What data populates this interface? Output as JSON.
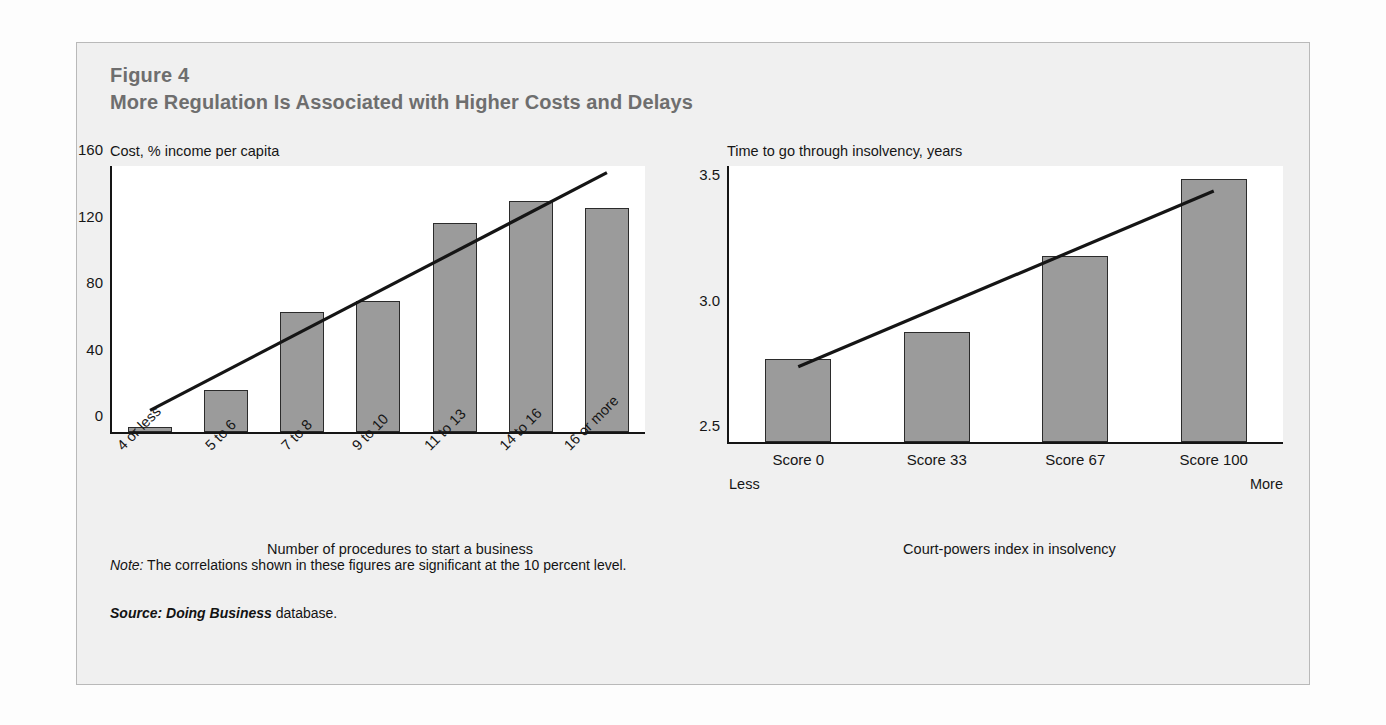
{
  "figure": {
    "number": "Figure 4",
    "title": "More Regulation Is Associated with Higher Costs and Delays",
    "note_label": "Note:",
    "note_text": " The correlations shown in these figures are significant at the 10 percent level.",
    "source_label": "Source:",
    "source_italic": " Doing Business",
    "source_text": " database."
  },
  "colors": {
    "bar_fill": "#9b9b9b",
    "bar_border": "#2b2b2b",
    "panel_bg": "#f0f0f0",
    "plot_bg": "#ffffff",
    "title_gray": "#6e6e6e",
    "axis": "#151515"
  },
  "chart_data": [
    {
      "type": "bar",
      "title": "Cost, % income per capita",
      "xlabel": "Number of procedures to start a business",
      "ylabel": "Cost, % income per capita",
      "categories": [
        "4 or less",
        "5 to 6",
        "7 to 8",
        "9 to 10",
        "11 to 13",
        "14 to 16",
        "16 or more"
      ],
      "values": [
        3,
        25,
        72,
        79,
        126,
        139,
        135
      ],
      "ylim": [
        0,
        160
      ],
      "yticks": [
        "0",
        "40",
        "80",
        "120",
        "160"
      ],
      "ytick_values": [
        0,
        40,
        80,
        120,
        160
      ],
      "grid": false,
      "legend": "none",
      "trendline": {
        "x_start_index": 0,
        "x_end_index": 6,
        "y_start": 13,
        "y_end": 156
      }
    },
    {
      "type": "bar",
      "title": "Time to go through insolvency, years",
      "xlabel": "Court-powers index in insolvency",
      "ylabel": "Time to go through insolvency, years",
      "categories": [
        "Score 0",
        "Score 33",
        "Score 67",
        "Score 100"
      ],
      "values": [
        2.83,
        2.94,
        3.24,
        3.55
      ],
      "ylim": [
        2.5,
        3.6
      ],
      "yticks": [
        "2.5",
        "3.0",
        "3.5"
      ],
      "ytick_values": [
        2.5,
        3.0,
        3.5
      ],
      "grid": false,
      "legend": "none",
      "endpoint_labels": {
        "left": "Less",
        "right": "More"
      },
      "trendline": {
        "x_start_index": 0,
        "x_end_index": 3,
        "y_start": 2.8,
        "y_end": 3.5
      }
    }
  ]
}
